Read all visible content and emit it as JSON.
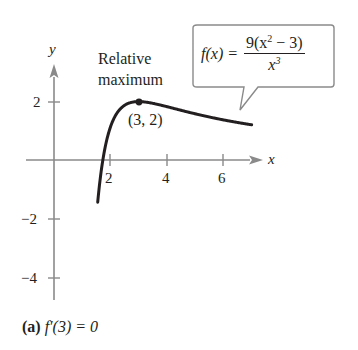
{
  "chart_data": {
    "type": "line",
    "title": "",
    "function": "f(x) = 9(x^2 - 3)/x^3",
    "xlabel": "x",
    "ylabel": "y",
    "xlim": [
      -1,
      7.8
    ],
    "ylim": [
      -5.2,
      2.8
    ],
    "x_ticks": [
      2,
      4,
      6
    ],
    "y_ticks": [
      2,
      -2,
      -4
    ],
    "grid": false,
    "series": [
      {
        "name": "f(x)",
        "x": [
          1.56,
          1.6,
          1.7,
          1.8,
          2.0,
          2.2,
          2.5,
          2.75,
          3.0,
          3.5,
          4.0,
          4.5,
          5.0,
          5.5,
          6.0,
          6.5,
          7.0
        ],
        "y": [
          -4.98,
          -4.13,
          -2.51,
          -1.22,
          1.13,
          1.43,
          1.87,
          1.97,
          2.0,
          1.94,
          1.83,
          1.71,
          1.58,
          1.47,
          1.38,
          1.29,
          1.21
        ]
      }
    ],
    "points": [
      {
        "x": 3,
        "y": 2,
        "label": "(3, 2)"
      }
    ],
    "annotations": [
      "Relative maximum",
      "(3, 2)",
      "f(x) = 9(x^2 - 3)/x^3"
    ]
  },
  "axes": {
    "x_label": "x",
    "y_label": "y",
    "x_tick_labels": [
      "2",
      "4",
      "6"
    ],
    "y_tick_labels": [
      "2",
      "−2",
      "−4"
    ]
  },
  "annotation": {
    "max_line1": "Relative",
    "max_line2": "maximum",
    "point_label": "(3, 2)"
  },
  "callout": {
    "lhs": "f(x) =",
    "num_prefix": "9(x",
    "num_exp": "2",
    "num_suffix": " − 3)",
    "den_base": "x",
    "den_exp": "3"
  },
  "caption": {
    "part": "(a)",
    "text": "f′(3) = 0"
  },
  "colors": {
    "curve": "#231f20",
    "axis": "#8a8a8a",
    "callout_border": "#8a8a8a"
  }
}
